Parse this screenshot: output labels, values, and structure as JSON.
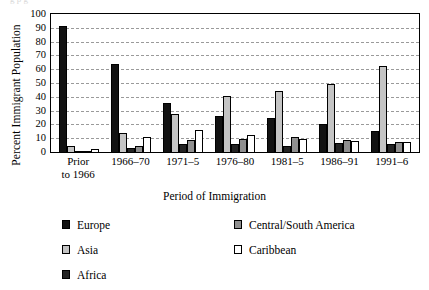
{
  "caption_remnant": "g                              p                   g",
  "chart_data": {
    "type": "bar",
    "title": "",
    "xlabel": "Period of Immigration",
    "ylabel": "Percent Immigrant Population",
    "ylim": [
      0,
      100
    ],
    "ytick_step": 10,
    "yticks": [
      "100",
      "90",
      "80",
      "70",
      "60",
      "50",
      "40",
      "30",
      "20",
      "10",
      "0"
    ],
    "grid": "horizontal-dashed",
    "legend_position": "below-plot-two-columns",
    "categories": [
      "Prior\nto 1966",
      "1966–70",
      "1971–5",
      "1976–80",
      "1981–5",
      "1986–91",
      "1991–6"
    ],
    "series": [
      {
        "name": "Europe",
        "color": "#121212",
        "values": [
          91,
          64,
          35.5,
          26,
          24.5,
          20.5,
          15.5
        ]
      },
      {
        "name": "Asia",
        "color": "#c4c4c4",
        "values": [
          4,
          14,
          27.5,
          40.5,
          44.5,
          49.5,
          62
        ]
      },
      {
        "name": "Africa",
        "color": "#232323",
        "values": [
          1,
          3,
          5.5,
          5.5,
          4,
          6.5,
          6
        ]
      },
      {
        "name": "Central/South America",
        "color": "#8f8f8f",
        "values": [
          1,
          4,
          9,
          9.5,
          11,
          9,
          7
        ]
      },
      {
        "name": "Caribbean",
        "color": "#ffffff",
        "values": [
          2.5,
          11,
          16,
          12,
          9.5,
          8,
          7
        ]
      }
    ]
  },
  "legend": {
    "left_column": [
      {
        "label": "Europe",
        "swatch": "s-europe"
      },
      {
        "label": "Asia",
        "swatch": "s-asia"
      },
      {
        "label": "Africa",
        "swatch": "s-africa"
      }
    ],
    "right_column": [
      {
        "label": "Central/South America",
        "swatch": "s-csamerica"
      },
      {
        "label": "Caribbean",
        "swatch": "s-caribbean"
      }
    ]
  }
}
